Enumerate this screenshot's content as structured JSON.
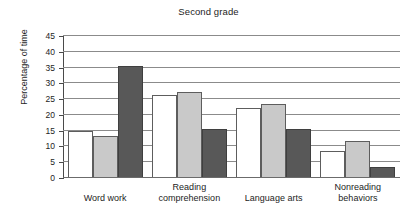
{
  "chart_data": {
    "type": "bar",
    "title": "Second grade",
    "xlabel": "",
    "ylabel": "Percentage of time",
    "categories": [
      "Word work",
      "Reading\ncomprehension",
      "Language arts",
      "Nonreading\nbehaviors"
    ],
    "ylim": [
      0,
      45
    ],
    "yticks": [
      0,
      5,
      10,
      15,
      20,
      25,
      30,
      35,
      40,
      45
    ],
    "ytick_labels": [
      "0",
      "5",
      "10",
      "15",
      "20",
      "25",
      "30",
      "35",
      "40",
      "45"
    ],
    "grid": true,
    "legend": "none",
    "series": [
      {
        "name": "series-1",
        "style": "white",
        "color": "#ffffff",
        "values": [
          15.0,
          26.4,
          22.2,
          8.5
        ]
      },
      {
        "name": "series-2",
        "style": "gray",
        "color": "#c9c9c9",
        "values": [
          13.4,
          27.2,
          23.4,
          11.8
        ]
      },
      {
        "name": "series-3",
        "style": "dark",
        "color": "#585858",
        "values": [
          35.6,
          15.4,
          15.4,
          3.5
        ]
      }
    ]
  }
}
